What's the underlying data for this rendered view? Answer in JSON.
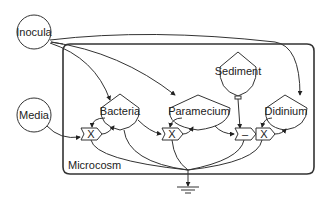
{
  "diagram": {
    "type": "stock-and-flow",
    "container": {
      "label": "Microcosm"
    },
    "sources": [
      {
        "id": "inocula",
        "label": "Inocula",
        "shape": "circle"
      },
      {
        "id": "media",
        "label": "Media",
        "shape": "circle"
      }
    ],
    "stocks": [
      {
        "id": "bacteria",
        "label": "Bacteria",
        "shape": "pentagon-drop"
      },
      {
        "id": "paramecium",
        "label": "Paramecium",
        "shape": "pentagon-drop"
      },
      {
        "id": "sediment",
        "label": "Sediment",
        "shape": "storage-tank"
      },
      {
        "id": "didinium",
        "label": "Didinium",
        "shape": "pentagon-drop"
      }
    ],
    "operators": [
      {
        "id": "op-media-bacteria",
        "symbol": "X",
        "shape": "interaction"
      },
      {
        "id": "op-bacteria-paramecium",
        "symbol": "X",
        "shape": "interaction"
      },
      {
        "id": "op-minus",
        "symbol": "–",
        "shape": "interaction"
      },
      {
        "id": "op-paramecium-didinium",
        "symbol": "X",
        "shape": "interaction"
      }
    ],
    "sink": {
      "id": "heat-sink",
      "shape": "ground"
    },
    "edges": [
      {
        "from": "inocula",
        "to": "bacteria"
      },
      {
        "from": "inocula",
        "to": "paramecium"
      },
      {
        "from": "inocula",
        "to": "didinium"
      },
      {
        "from": "inocula",
        "to": "microcosm"
      },
      {
        "from": "media",
        "to": "op-media-bacteria"
      },
      {
        "from": "bacteria",
        "to": "op-media-bacteria"
      },
      {
        "from": "op-media-bacteria",
        "to": "bacteria"
      },
      {
        "from": "bacteria",
        "to": "op-bacteria-paramecium"
      },
      {
        "from": "paramecium",
        "to": "op-bacteria-paramecium"
      },
      {
        "from": "op-bacteria-paramecium",
        "to": "paramecium"
      },
      {
        "from": "sediment",
        "to": "op-minus"
      },
      {
        "from": "paramecium",
        "to": "op-minus"
      },
      {
        "from": "didinium",
        "to": "op-paramecium-didinium"
      },
      {
        "from": "op-paramecium-didinium",
        "to": "didinium"
      },
      {
        "from": "bacteria",
        "to": "heat-sink"
      },
      {
        "from": "op-media-bacteria",
        "to": "heat-sink"
      },
      {
        "from": "paramecium",
        "to": "heat-sink"
      },
      {
        "from": "op-minus",
        "to": "heat-sink"
      },
      {
        "from": "op-paramecium-didinium",
        "to": "heat-sink"
      }
    ]
  }
}
